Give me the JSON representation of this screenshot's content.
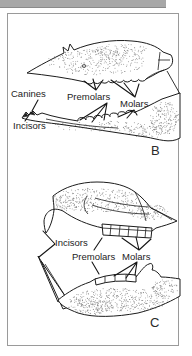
{
  "window": {
    "top_bar_color": "#a8a8a8"
  },
  "figure": {
    "colors": {
      "ink": "#1c1c1c",
      "frame": "#9a9a9a",
      "background": "#ffffff",
      "stipple": "#3d3d3d"
    },
    "panel_b": {
      "letter": "B",
      "labels": {
        "canines": "Canines",
        "premolars": "Premolars",
        "molars": "Molars",
        "incisors": "Incisors"
      }
    },
    "panel_c": {
      "letter": "C",
      "labels": {
        "incisors": "Incisors",
        "premolars": "Premolars",
        "molars": "Molars"
      }
    }
  }
}
